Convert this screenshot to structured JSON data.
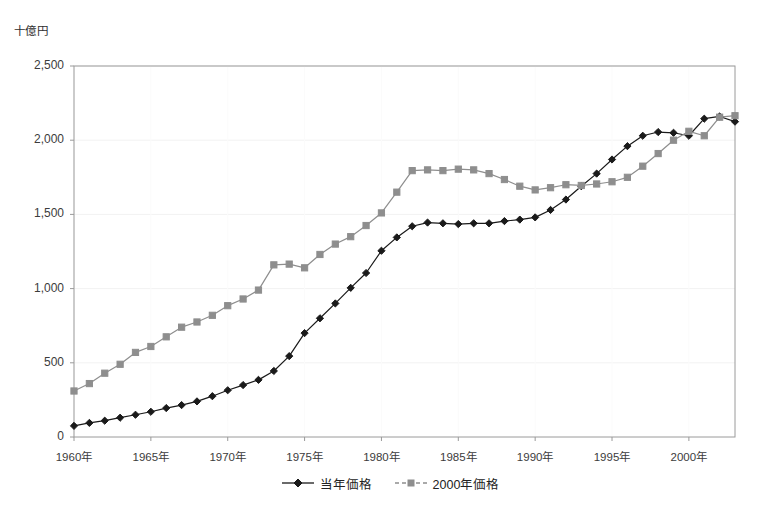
{
  "chart_data": {
    "type": "line",
    "title": "",
    "unit_label": "十億円",
    "xlabel": "",
    "ylabel": "",
    "ylim": [
      0,
      2500
    ],
    "yticks": [
      0,
      500,
      1000,
      1500,
      2000,
      2500
    ],
    "ytick_labels": [
      "0",
      "500",
      "1,000",
      "1,500",
      "2,000",
      "2,500"
    ],
    "xlim": [
      1960,
      2003
    ],
    "xticks": [
      1960,
      1965,
      1970,
      1975,
      1980,
      1985,
      1990,
      1995,
      2000
    ],
    "xtick_labels": [
      "1960年",
      "1965年",
      "1970年",
      "1975年",
      "1980年",
      "1985年",
      "1990年",
      "1995年",
      "2000年"
    ],
    "x": [
      1960,
      1961,
      1962,
      1963,
      1964,
      1965,
      1966,
      1967,
      1968,
      1969,
      1970,
      1971,
      1972,
      1973,
      1974,
      1975,
      1976,
      1977,
      1978,
      1979,
      1980,
      1981,
      1982,
      1983,
      1984,
      1985,
      1986,
      1987,
      1988,
      1989,
      1990,
      1991,
      1992,
      1993,
      1994,
      1995,
      1996,
      1997,
      1998,
      1999,
      2000,
      2001,
      2002,
      2003
    ],
    "grid": true,
    "legend_position": "bottom",
    "series": [
      {
        "name": "当年価格",
        "marker": "diamond",
        "color": "#1a1a1a",
        "line_style": "solid",
        "values": [
          75,
          95,
          110,
          130,
          150,
          170,
          195,
          215,
          240,
          275,
          315,
          350,
          385,
          445,
          545,
          700,
          800,
          900,
          1005,
          1105,
          1255,
          1345,
          1420,
          1445,
          1440,
          1435,
          1440,
          1440,
          1455,
          1465,
          1480,
          1530,
          1600,
          1690,
          1775,
          1870,
          1960,
          2030,
          2055,
          2050,
          2030,
          2145,
          2160,
          2125
        ]
      },
      {
        "name": "2000年価格",
        "marker": "square",
        "color": "#8e8e8e",
        "line_style": "solid",
        "values": [
          310,
          360,
          430,
          490,
          570,
          610,
          675,
          740,
          775,
          820,
          885,
          930,
          990,
          1160,
          1165,
          1140,
          1230,
          1300,
          1350,
          1425,
          1510,
          1650,
          1795,
          1800,
          1795,
          1805,
          1800,
          1775,
          1735,
          1690,
          1665,
          1680,
          1700,
          1695,
          1705,
          1720,
          1750,
          1825,
          1910,
          2000,
          2060,
          2030,
          2155,
          2165
        ]
      }
    ]
  },
  "legend": {
    "items": [
      {
        "label": "当年価格"
      },
      {
        "label": "2000年価格"
      }
    ]
  },
  "colors": {
    "series_current": "#1a1a1a",
    "series_constant": "#8e8e8e",
    "axis": "#9a9a9a",
    "grid": "#f2f2f2",
    "text": "#3c3c3c",
    "background": "#ffffff"
  }
}
